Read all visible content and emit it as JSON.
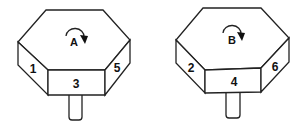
{
  "figure": {
    "pieces": [
      {
        "id": "A",
        "top_label": "A",
        "rotation": "clockwise",
        "faces": {
          "left": "1",
          "front": "3",
          "right": "5"
        }
      },
      {
        "id": "B",
        "top_label": "B",
        "rotation": "clockwise",
        "faces": {
          "left": "2",
          "front": "4",
          "right": "6"
        }
      }
    ],
    "colors": {
      "stroke": "#222222",
      "fill": "#ffffff",
      "text": "#111111"
    }
  }
}
